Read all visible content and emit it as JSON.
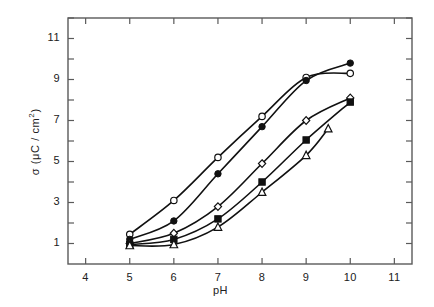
{
  "chart_data": {
    "type": "line",
    "title": "",
    "xlabel": "pH",
    "ylabel": "σ ( μC / cm² )",
    "ylabel_parts": {
      "sigma": "σ",
      "open_paren": "(",
      "mu": "μ",
      "c_slash": "C /",
      "cm": "cm",
      "exponent": "2",
      "close_paren": ")"
    },
    "xlim": [
      3.6,
      11.4
    ],
    "ylim": [
      0.0,
      12.0
    ],
    "xticks": [
      4,
      5,
      6,
      7,
      8,
      9,
      10,
      11
    ],
    "xtick_labels": [
      "4",
      "5",
      "6",
      "7",
      "8",
      "9",
      "10",
      "11"
    ],
    "yticks": [
      1,
      2,
      3,
      4,
      5,
      6,
      7,
      8,
      9,
      10,
      11,
      12
    ],
    "ytick_labels_shown": [
      "1",
      "3",
      "5",
      "7",
      "9",
      "11"
    ],
    "ytick_label_values": [
      1,
      3,
      5,
      7,
      9,
      11
    ],
    "grid": false,
    "legend": "none",
    "line_color": "#111111",
    "background": "#ffffff",
    "frame_color": "#5a5a5a",
    "series": [
      {
        "name": "series-open-circle",
        "marker": "open-circle",
        "filled": false,
        "x": [
          5,
          6,
          7,
          8,
          9,
          10
        ],
        "values": [
          1.45,
          3.1,
          5.2,
          7.2,
          9.1,
          9.3
        ]
      },
      {
        "name": "series-filled-circle",
        "marker": "filled-circle",
        "filled": true,
        "x": [
          5,
          6,
          7,
          8,
          9,
          10
        ],
        "values": [
          1.2,
          2.1,
          4.4,
          6.7,
          8.95,
          9.8
        ]
      },
      {
        "name": "series-open-diamond",
        "marker": "open-diamond",
        "filled": false,
        "x": [
          5,
          6,
          7,
          8,
          9,
          10
        ],
        "values": [
          1.0,
          1.5,
          2.8,
          4.9,
          7.0,
          8.1
        ]
      },
      {
        "name": "series-filled-square",
        "marker": "filled-square",
        "filled": true,
        "x": [
          5,
          6,
          7,
          8,
          9,
          10
        ],
        "values": [
          0.95,
          1.2,
          2.2,
          4.0,
          6.05,
          7.9
        ]
      },
      {
        "name": "series-open-triangle",
        "marker": "open-triangle",
        "filled": false,
        "x": [
          5,
          6,
          7,
          8,
          9,
          9.5
        ],
        "values": [
          0.9,
          0.95,
          1.8,
          3.5,
          5.3,
          6.6
        ]
      }
    ]
  }
}
